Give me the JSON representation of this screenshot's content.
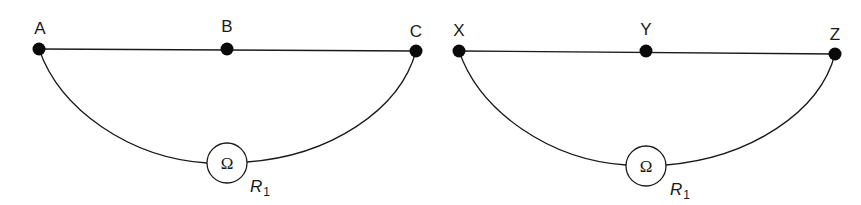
{
  "circuits": [
    {
      "name": "circuit-abc",
      "wire_label_points": [
        {
          "label": "A",
          "x": 39,
          "y": 49
        },
        {
          "label": "B",
          "x": 227,
          "y": 49
        },
        {
          "label": "C",
          "x": 416,
          "y": 51
        }
      ],
      "meter": {
        "symbol": "Ω",
        "cx": 227,
        "cy": 163,
        "r": 20
      },
      "resistor_label": {
        "main": "R",
        "sub": "1"
      }
    },
    {
      "name": "circuit-xyz",
      "wire_label_points": [
        {
          "label": "X",
          "x": 459,
          "y": 51
        },
        {
          "label": "Y",
          "x": 646,
          "y": 51
        },
        {
          "label": "Z",
          "x": 835,
          "y": 54
        }
      ],
      "meter": {
        "symbol": "Ω",
        "cx": 646,
        "cy": 166,
        "r": 20
      },
      "resistor_label": {
        "main": "R",
        "sub": "1"
      }
    }
  ],
  "colors": {
    "line": "#1a1a1a",
    "node": "#0a0a0a",
    "background": "#ffffff"
  }
}
